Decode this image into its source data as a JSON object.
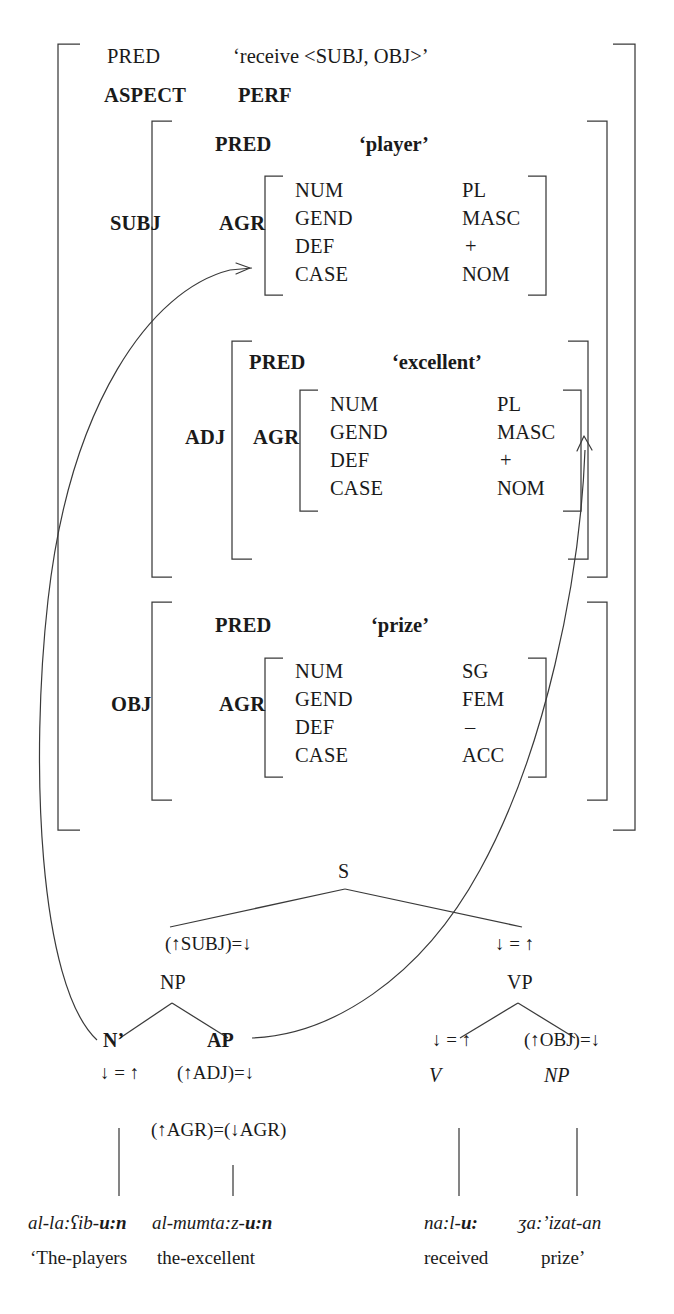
{
  "fstructure": {
    "top_attrs": [
      {
        "attr": "PRED",
        "value": "‘receive <SUBJ, OBJ>’"
      },
      {
        "attr": "ASPECT",
        "value": "PERF"
      }
    ],
    "grammatical_functions": [
      {
        "name": "SUBJ",
        "pred_attr": "PRED",
        "pred_value": "‘player’",
        "agr_attr": "AGR",
        "agr_rows": [
          {
            "feature": "NUM",
            "value": "PL"
          },
          {
            "feature": "GEND",
            "value": "MASC"
          },
          {
            "feature": "DEF",
            "value": "+"
          },
          {
            "feature": "CASE",
            "value": "NOM"
          }
        ]
      },
      {
        "name": "ADJ",
        "pred_attr": "PRED",
        "pred_value": "‘excellent’",
        "agr_attr": "AGR",
        "agr_rows": [
          {
            "feature": "NUM",
            "value": "PL"
          },
          {
            "feature": "GEND",
            "value": "MASC"
          },
          {
            "feature": "DEF",
            "value": "+"
          },
          {
            "feature": "CASE",
            "value": "NOM"
          }
        ]
      },
      {
        "name": "OBJ",
        "pred_attr": "PRED",
        "pred_value": "‘prize’",
        "agr_attr": "AGR",
        "agr_rows": [
          {
            "feature": "NUM",
            "value": "SG"
          },
          {
            "feature": "GEND",
            "value": "FEM"
          },
          {
            "feature": "DEF",
            "value": "–"
          },
          {
            "feature": "CASE",
            "value": "ACC"
          }
        ]
      }
    ]
  },
  "cstructure": {
    "root": "S",
    "nodes": {
      "np_subj": "NP",
      "vp": "VP",
      "nbar": "N’",
      "ap": "AP",
      "v": "V",
      "np_obj": "NP"
    },
    "equations": {
      "subj": "(↑SUBJ)=↓",
      "vp_head": "↓ = ↑",
      "nbar_head": "↓ = ↑",
      "adj": "(↑ADJ)=↓",
      "agr_share": "(↑AGR)=(↓AGR)",
      "v_head": "↓ = ↑",
      "obj": "(↑OBJ)=↓"
    }
  },
  "terminals": [
    {
      "form_plain": "al-la:ʕib-",
      "form_bold": "u:n",
      "gloss": "‘The-players"
    },
    {
      "form_plain": "al-mumta:z-",
      "form_bold": "u:n",
      "gloss": "the-excellent"
    },
    {
      "form_plain": "na:l-",
      "form_bold": "u:",
      "gloss": "received"
    },
    {
      "form_plain": "ʒa:ʼizat-an",
      "form_bold": "",
      "gloss": "prize’"
    }
  ],
  "colors": {
    "ink": "#1a1a1a",
    "rule": "#3a3a3a",
    "background": "#ffffff"
  }
}
